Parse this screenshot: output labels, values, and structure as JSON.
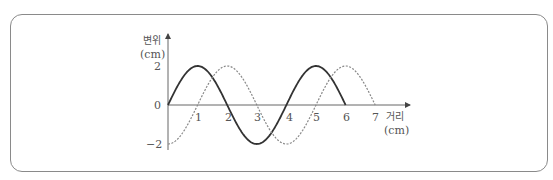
{
  "chart_data": {
    "type": "line",
    "title": "",
    "xlabel": "거리",
    "xlabel_unit": "(cm)",
    "ylabel": "변위",
    "ylabel_unit": "(cm)",
    "x_ticks": [
      "1",
      "2",
      "3",
      "4",
      "5",
      "6",
      "7"
    ],
    "y_ticks": [
      "2",
      "0",
      "-2"
    ],
    "xlim": [
      0,
      7
    ],
    "ylim": [
      -2,
      2
    ],
    "grid": false,
    "legend": null,
    "series": [
      {
        "name": "solid-wave",
        "style": "solid",
        "color": "#333333",
        "description": "y = 2 sin(πx/2), x from 0 to 6",
        "x": [
          0,
          1,
          2,
          3,
          4,
          5,
          6
        ],
        "y": [
          0,
          2,
          0,
          -2,
          0,
          2,
          0
        ]
      },
      {
        "name": "dotted-wave",
        "style": "dotted",
        "color": "#888888",
        "description": "y = -2 cos(πx/2), x from 0 to 7",
        "x": [
          0,
          1,
          2,
          3,
          4,
          5,
          6,
          7
        ],
        "y": [
          -2,
          0,
          2,
          0,
          -2,
          0,
          2,
          0
        ]
      }
    ]
  },
  "labels": {
    "y_name": "변위",
    "y_unit": "(cm)",
    "x_name": "거리",
    "x_unit": "(cm)",
    "origin": "0",
    "y_max": "2",
    "y_min": "−2",
    "x1": "1",
    "x2": "2",
    "x3": "3",
    "x4": "4",
    "x5": "5",
    "x6": "6",
    "x7": "7"
  }
}
